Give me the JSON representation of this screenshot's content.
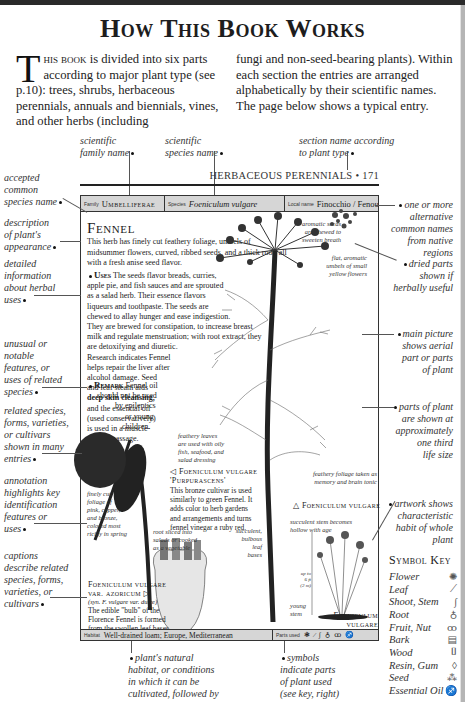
{
  "page": {
    "title": "How This Book Works"
  },
  "intro": {
    "dropcap": "T",
    "lead_smallcaps": "his book",
    "col1_rest": " is divided into six parts according to major plant type (see p.10): trees, shrubs, herbaceous perennials, annuals and biennials, vines, and other herbs (including",
    "col2": "fungi and non-seed-bearing plants). Within each section the entries are arranged alphabetically by their scientific names. The page below shows a typical entry."
  },
  "annotations": {
    "top": {
      "family": [
        "scientific",
        "family name"
      ],
      "species": [
        "scientific",
        "species name"
      ],
      "section": [
        "section name according",
        "to plant type"
      ]
    },
    "left": {
      "common_name": [
        "accepted",
        "common",
        "species name"
      ],
      "appearance": [
        "description",
        "of plant's",
        "appearance"
      ],
      "herbal_uses": [
        "detailed",
        "information",
        "about herbal",
        "uses"
      ],
      "unusual": [
        "unusual or",
        "notable",
        "features, or",
        "uses of related",
        "species"
      ],
      "related": [
        "related species,",
        "forms, varieties,",
        "or cultivars",
        "shown in many",
        "entries"
      ],
      "annotation": [
        "annotation",
        "highlights key",
        "identification",
        "features or",
        "uses"
      ],
      "captions": [
        "captions",
        "describe related",
        "species, forms,",
        "varieties, or",
        "cultivars"
      ]
    },
    "right": {
      "alt_names": [
        "one or more",
        "alternative",
        "common names",
        "from native",
        "regions"
      ],
      "dried_parts": [
        "dried parts",
        "shown if",
        "herbally useful"
      ],
      "main_picture": [
        "main picture",
        "shows aerial",
        "part or parts",
        "of plant"
      ],
      "scale": [
        "parts of plant",
        "are shown at",
        "approximately",
        "one third",
        "life size"
      ],
      "artwork": [
        "artwork shows",
        "characteristic",
        "habit of whole",
        "plant"
      ]
    },
    "bottom": {
      "habitat": [
        "plant's natural",
        "habitat, or conditions",
        "in which it can be",
        "cultivated, followed by",
        "plant's native region"
      ],
      "symbols": [
        "symbols",
        "indicate parts",
        "of plant used",
        "(see key, right)"
      ]
    }
  },
  "sample_page": {
    "section_header": "HERBACEOUS PERENNIALS • 171",
    "infobar": {
      "family_label": "Family",
      "family_value": "Umbelliferae",
      "species_label": "Species",
      "species_value": "Foeniculum vulgare",
      "local_label": "Local name",
      "local_value": "Finocchio / Fenouil"
    },
    "herb_name": "Fennel",
    "description": "This herb has finely cut feathery foliage, umbels of midsummer flowers, curved, ribbed seeds, and a thick root, all with a fresh anise seed flavor.",
    "uses_heading": "Uses",
    "uses_lines": [
      "The seeds flavor breads, curries,",
      "apple pie, and fish sauces and are sprouted",
      "as a salad herb. Their essence flavors",
      "liqueurs and toothpaste. The seeds are",
      "chewed to allay hunger and ease indigestion.",
      "They are brewed for constipation, to increase breast",
      "milk and regulate menstruation; with root extract, they",
      "are detoxifying and diuretic.",
      "Research indicates Fennel",
      "helps repair the liver after",
      "alcohol damage. Seed",
      "and leaf steam aids",
      "deep skin cleansing,",
      "and the essential oil",
      "(used conservatively)",
      "is used in a muscle-",
      "toning massage."
    ],
    "remark_heading": "Remark",
    "remark_lines": [
      "Fennel oil",
      "should not be used",
      "by epileptics",
      "or young",
      "children."
    ],
    "callouts": {
      "seeds": [
        "aromatic seeds",
        "are chewed to",
        "sweeten breath"
      ],
      "umbels": [
        "flat, aromatic",
        "umbels of small",
        "yellow flowers"
      ],
      "leaves": [
        "feathery leaves",
        "are used with oily",
        "fish, seafood, and",
        "salad dressing"
      ],
      "bronze_foliage": [
        "finely cut",
        "foliage of",
        "pink, copper,",
        "and bronze,",
        "colored most",
        "richly in spring"
      ],
      "foliage_tonic": [
        "feathery foliage taken as",
        "memory and brain tonic"
      ],
      "stem": [
        "succulent stem becomes",
        "hollow with age"
      ],
      "root": [
        "root sliced into",
        "salads or cooked",
        "as a vegetable"
      ],
      "bulb": [
        "succulent,",
        "bulbous",
        "leaf",
        "bases"
      ],
      "young_stem": [
        "young",
        "stem"
      ],
      "height": [
        "up to",
        "6 ft",
        "(2 m)"
      ]
    },
    "purpurascens": {
      "title": "◁ Foeniculum vulgare",
      "title2": "'Purpurascens'",
      "body": [
        "This bronze cultivar is used",
        "similarly to green Fennel. It",
        "adds color to herb gardens",
        "and arrangements and turns",
        "fennel vinegar a ruby red."
      ]
    },
    "vulgare_label": "△ Foeniculum vulgare",
    "azoricum": {
      "title": "Foeniculum vulgare",
      "title2": "var. azoricum ▷",
      "syn": "(syn. F. vulgare var. dulce)",
      "body": [
        "The edible \"bulb\" of the",
        "Florence Fennel is formed",
        "from the swollen leaf bases."
      ]
    },
    "habit_caption": [
      "Foeniculum",
      "vulgare"
    ],
    "habitat_label": "Habitat",
    "habitat_value": "Well-drained loam; Europe, Mediterranean",
    "parts_label": "Parts used",
    "parts_glyphs": [
      "❃",
      "⁄",
      "∫",
      "♁",
      "ꝏ",
      "♐"
    ]
  },
  "symbol_key": {
    "title": "Symbol Key",
    "items": [
      {
        "label": "Flower",
        "icon": "flower-icon",
        "glyph": "✺"
      },
      {
        "label": "Leaf",
        "icon": "leaf-icon",
        "glyph": "⟋"
      },
      {
        "label": "Shoot, Stem",
        "icon": "stem-icon",
        "glyph": "∫"
      },
      {
        "label": "Root",
        "icon": "root-icon",
        "glyph": "♁"
      },
      {
        "label": "Fruit, Nut",
        "icon": "fruit-icon",
        "glyph": "ꝏ"
      },
      {
        "label": "Bark",
        "icon": "bark-icon",
        "glyph": "▤"
      },
      {
        "label": "Wood",
        "icon": "wood-icon",
        "glyph": "⌷"
      },
      {
        "label": "Resin, Gum",
        "icon": "resin-icon",
        "glyph": "◊"
      },
      {
        "label": "Seed",
        "icon": "seed-icon",
        "glyph": "⁂"
      },
      {
        "label": "Essential Oil",
        "icon": "essential-oil-icon",
        "glyph": "♐"
      }
    ]
  }
}
